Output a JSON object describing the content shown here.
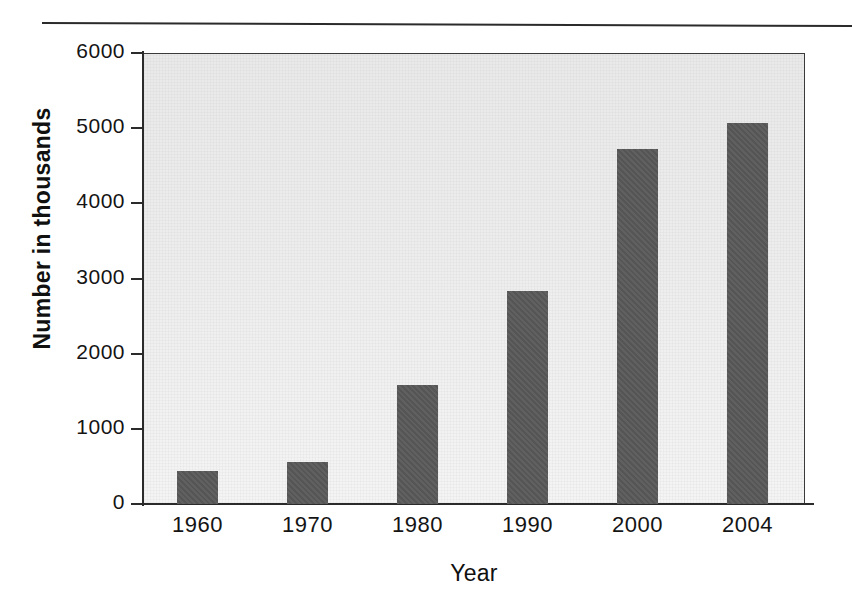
{
  "chart_data": {
    "type": "bar",
    "title": "",
    "subtitle": "",
    "xlabel": "Year",
    "ylabel": "Number in thousands",
    "categories": [
      "1960",
      "1970",
      "1980",
      "1990",
      "2000",
      "2004"
    ],
    "values": [
      440,
      560,
      1580,
      2830,
      4720,
      5070
    ],
    "series": [
      {
        "name": "Number in thousands",
        "values": [
          440,
          560,
          1580,
          2830,
          4720,
          5070
        ]
      }
    ],
    "ylim": [
      0,
      6000
    ],
    "ytick_labels": [
      "6000",
      "5000",
      "4000",
      "3000",
      "2000",
      "1000",
      "0"
    ],
    "ytick_values": [
      6000,
      5000,
      4000,
      3000,
      2000,
      1000,
      0
    ],
    "xtick_labels": [
      "1960",
      "1970",
      "1980",
      "1990",
      "2000",
      "2004"
    ],
    "grid": false,
    "legend": null,
    "legend_position": "none",
    "annotations": [],
    "colors": {
      "bar_fill": "#59595a",
      "plot_background": "#ededed",
      "axis": "#2b2b2b",
      "text": "#141414",
      "page_background": "#ffffff"
    }
  },
  "figure": {
    "top_rule": "horizontal-rule"
  }
}
